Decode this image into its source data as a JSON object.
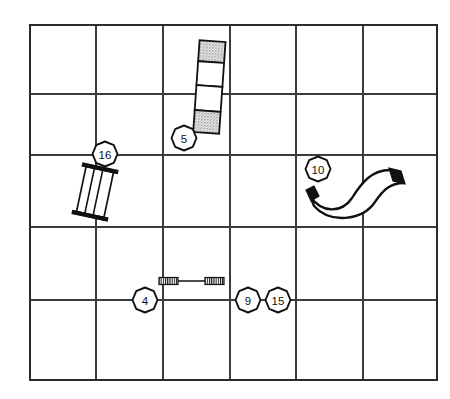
{
  "figure": {
    "name": "exploded-parts-location-grid",
    "background_color": "#ffffff",
    "line_color": "#111111",
    "grid_color": "#3c3c3c",
    "shade_color": "#9a9a9a"
  },
  "grid": {
    "name": "reference-grid",
    "x_positions": [
      30,
      96,
      163,
      230,
      296,
      363,
      437
    ],
    "y_positions": [
      25,
      94,
      155,
      227,
      300,
      380
    ],
    "columns": 6,
    "rows": 5
  },
  "callouts": [
    {
      "id": "callout-5",
      "label": "5",
      "cx": 184,
      "cy": 138,
      "r": 12.5
    },
    {
      "id": "callout-16",
      "label": "16",
      "cx": 105,
      "cy": 154,
      "r": 12.5
    },
    {
      "id": "callout-10",
      "label": "10",
      "cx": 318,
      "cy": 169,
      "r": 12.5
    },
    {
      "id": "callout-4",
      "label": "4",
      "cx": 145,
      "cy": 300,
      "r": 12.5
    },
    {
      "id": "callout-9",
      "label": "9",
      "cx": 248,
      "cy": 300,
      "r": 12.5
    },
    {
      "id": "callout-15",
      "label": "15",
      "cx": 278,
      "cy": 300,
      "r": 12.5
    }
  ],
  "parts": [
    {
      "id": "part-5",
      "name": "segmented-bar",
      "callout": "5",
      "description": "vertical four-segment bar, top and bottom segments shaded",
      "segments": [
        "shaded",
        "plain",
        "plain",
        "shaded"
      ]
    },
    {
      "id": "part-16",
      "name": "tilted-grate",
      "callout": "16",
      "description": "tilted rectangular grate with three vertical bars and end caps",
      "bar_count": 3
    },
    {
      "id": "part-10",
      "name": "s-curved-hose",
      "callout": "10",
      "description": "S-shaped flexible hose with solid black cuffs at both ends",
      "cuff_count": 2
    },
    {
      "id": "part-4-9-15",
      "name": "threaded-tie-rod",
      "callout": "4",
      "description": "horizontal tie rod with threaded collars at both ends",
      "collar_count": 2
    }
  ]
}
